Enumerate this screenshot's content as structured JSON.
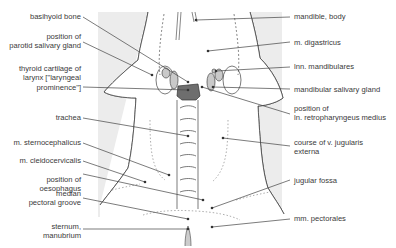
{
  "diagram": {
    "colors": {
      "background_panel": "#ececec",
      "outline": "#444444",
      "gland_fill": "#c9c9c9",
      "thyroid_cartilage_fill": "#6e6e6e",
      "label_text": "#3a3a3a"
    },
    "left_labels": [
      {
        "id": "basihyoid",
        "lines": [
          "basihyoid bone"
        ]
      },
      {
        "id": "parotid",
        "lines": [
          "position of",
          "parotid salivary gland"
        ]
      },
      {
        "id": "thyroid",
        "lines": [
          "thyroid cartilage of",
          "larynx [\"laryngeal",
          "prominence\"]"
        ]
      },
      {
        "id": "trachea",
        "lines": [
          "trachea"
        ]
      },
      {
        "id": "sternocephalicus",
        "lines": [
          "m. sternocephalicus"
        ]
      },
      {
        "id": "cleidocervicalis",
        "lines": [
          "m. cleidocervicalis"
        ]
      },
      {
        "id": "oesophagus",
        "lines": [
          "position of",
          "oesophagus"
        ]
      },
      {
        "id": "pectoral_groove",
        "lines": [
          "median",
          "pectoral groove"
        ]
      },
      {
        "id": "sternum",
        "lines": [
          "sternum,",
          "manubrium"
        ]
      }
    ],
    "right_labels": [
      {
        "id": "mandible",
        "lines": [
          "mandible, body"
        ]
      },
      {
        "id": "digastricus",
        "lines": [
          "m. digastricus"
        ]
      },
      {
        "id": "lnn_mandibulares",
        "lines": [
          "lnn. mandibulares"
        ]
      },
      {
        "id": "mandibular_gland",
        "lines": [
          "mandibular salivary gland"
        ]
      },
      {
        "id": "retropharyngeus",
        "lines": [
          "position of",
          "ln. retropharyngeus medius"
        ]
      },
      {
        "id": "jugularis",
        "lines": [
          "course of v. jugularis",
          "externa"
        ]
      },
      {
        "id": "jugular_fossa",
        "lines": [
          "jugular fossa"
        ]
      },
      {
        "id": "pectorales",
        "lines": [
          "mm. pectorales"
        ]
      }
    ]
  }
}
